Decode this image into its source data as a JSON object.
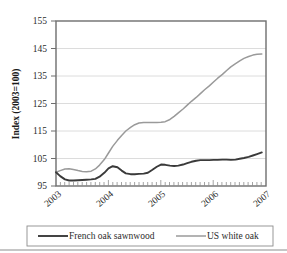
{
  "chart_data": {
    "type": "line",
    "title": "",
    "xlabel": "",
    "ylabel": "Index (2003=100)",
    "ylim": [
      95,
      155
    ],
    "yticks": [
      95,
      105,
      115,
      125,
      135,
      145,
      155
    ],
    "xticks": [
      "2003",
      "2004",
      "2005",
      "2006",
      "2007"
    ],
    "xlim": [
      2003.0,
      2007.0
    ],
    "grid": "horizontal",
    "legend_position": "bottom",
    "colors": {
      "french_oak_sawnwood": "#3a3a3a",
      "us_white_oak": "#9a9a9a",
      "axis": "#6e6e6e",
      "grid": "#d9d9d9"
    },
    "series": [
      {
        "name": "French oak sawnwood",
        "color": "#3a3a3a",
        "x": [
          2003.0,
          2003.08,
          2003.17,
          2003.25,
          2003.33,
          2003.42,
          2003.5,
          2003.58,
          2003.67,
          2003.75,
          2003.83,
          2003.92,
          2004.0,
          2004.08,
          2004.17,
          2004.25,
          2004.33,
          2004.42,
          2004.5,
          2004.58,
          2004.67,
          2004.75,
          2004.83,
          2004.92,
          2005.0,
          2005.08,
          2005.17,
          2005.25,
          2005.33,
          2005.42,
          2005.5,
          2005.58,
          2005.67,
          2005.75,
          2005.83,
          2005.92,
          2006.0,
          2006.08,
          2006.17,
          2006.25,
          2006.33,
          2006.42,
          2006.5,
          2006.58,
          2006.67,
          2006.75,
          2006.83,
          2006.92
        ],
        "values": [
          100.0,
          98.6,
          97.4,
          97.0,
          97.0,
          97.1,
          97.2,
          97.3,
          97.4,
          97.6,
          98.4,
          99.8,
          101.4,
          102.2,
          101.8,
          100.6,
          99.6,
          99.3,
          99.3,
          99.4,
          99.5,
          99.8,
          100.8,
          102.0,
          102.8,
          102.7,
          102.4,
          102.3,
          102.4,
          102.8,
          103.3,
          103.8,
          104.2,
          104.4,
          104.4,
          104.4,
          104.5,
          104.5,
          104.6,
          104.6,
          104.5,
          104.6,
          104.9,
          105.2,
          105.6,
          106.1,
          106.6,
          107.2
        ]
      },
      {
        "name": "US white oak",
        "color": "#9a9a9a",
        "x": [
          2003.0,
          2003.08,
          2003.17,
          2003.25,
          2003.33,
          2003.42,
          2003.5,
          2003.58,
          2003.67,
          2003.75,
          2003.83,
          2003.92,
          2004.0,
          2004.08,
          2004.17,
          2004.25,
          2004.33,
          2004.42,
          2004.5,
          2004.58,
          2004.67,
          2004.75,
          2004.83,
          2004.92,
          2005.0,
          2005.08,
          2005.17,
          2005.25,
          2005.33,
          2005.42,
          2005.5,
          2005.58,
          2005.67,
          2005.75,
          2005.83,
          2005.92,
          2006.0,
          2006.08,
          2006.17,
          2006.25,
          2006.33,
          2006.42,
          2006.5,
          2006.58,
          2006.67,
          2006.75,
          2006.83,
          2006.92
        ],
        "values": [
          100.0,
          100.6,
          101.2,
          101.3,
          101.0,
          100.6,
          100.3,
          100.2,
          100.4,
          101.2,
          102.6,
          104.6,
          107.0,
          109.4,
          111.6,
          113.4,
          115.0,
          116.3,
          117.3,
          117.9,
          118.1,
          118.1,
          118.1,
          118.1,
          118.2,
          118.4,
          119.2,
          120.3,
          121.6,
          123.0,
          124.4,
          125.8,
          127.2,
          128.6,
          130.0,
          131.4,
          132.8,
          134.2,
          135.6,
          137.0,
          138.3,
          139.5,
          140.5,
          141.4,
          142.1,
          142.6,
          142.9,
          143.0
        ]
      }
    ]
  },
  "legend": {
    "items": [
      {
        "label": "French oak sawnwood",
        "color": "#3a3a3a"
      },
      {
        "label": "US white oak",
        "color": "#9a9a9a"
      }
    ]
  },
  "axes": {
    "y_title": "Index (2003=100)",
    "y_tick_0": "95",
    "y_tick_1": "105",
    "y_tick_2": "115",
    "y_tick_3": "125",
    "y_tick_4": "135",
    "y_tick_5": "145",
    "y_tick_6": "155",
    "x_tick_0": "2003",
    "x_tick_1": "2004",
    "x_tick_2": "2005",
    "x_tick_3": "2006",
    "x_tick_4": "2007"
  }
}
